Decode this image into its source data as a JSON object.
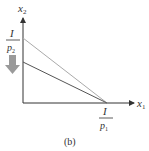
{
  "figure": {
    "caption": "(b)",
    "axes": {
      "x_label": "x",
      "x_sub": "1",
      "y_label": "x",
      "y_sub": "2"
    },
    "intercepts": {
      "y": {
        "num": "I",
        "den": "p",
        "den_sub": "2"
      },
      "x": {
        "num": "I",
        "den": "p",
        "den_sub": "1"
      }
    },
    "lines": [
      {
        "name": "original-budget-line",
        "color": "#aaaaaa"
      },
      {
        "name": "new-budget-line",
        "color": "#555555"
      }
    ],
    "shift_arrow": {
      "direction": "down",
      "color": "#9a9a9a"
    }
  }
}
